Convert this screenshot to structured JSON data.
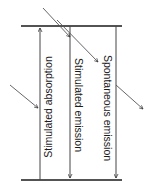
{
  "diagram": {
    "upper_level": "upper energy level",
    "lower_level": "lower energy level",
    "processes": [
      {
        "label": "Stimulated absorption",
        "direction": "up"
      },
      {
        "label": "Stimulated emission",
        "direction": "down"
      },
      {
        "label": "Spontaneous emission",
        "direction": "down"
      }
    ],
    "colors": {
      "line": "#1a1a1a",
      "photon": "#333333"
    }
  }
}
